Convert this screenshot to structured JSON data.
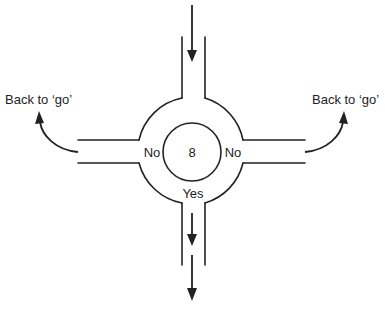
{
  "diagram": {
    "type": "flow-roundabout",
    "decision_node": {
      "label": "8",
      "branches": {
        "left": "No",
        "right": "No",
        "bottom": "Yes"
      }
    },
    "left_exit": {
      "label": "Back to ‘go’"
    },
    "right_exit": {
      "label": "Back to ‘go’"
    },
    "entry": {
      "direction": "top",
      "arrow": "down-arrow"
    },
    "exit": {
      "direction": "bottom",
      "arrow": "down-arrow"
    },
    "colors": {
      "stroke": "#222222",
      "text": "#1e1e1e",
      "background": "#ffffff"
    }
  }
}
